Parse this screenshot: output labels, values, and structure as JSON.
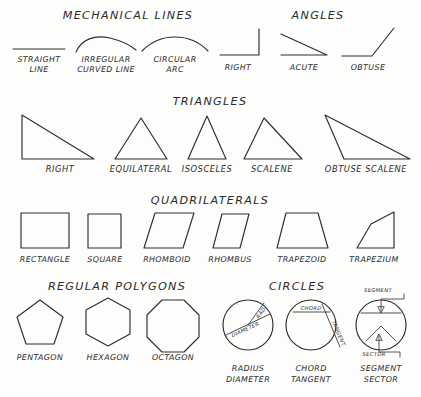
{
  "sheet": {
    "title": "Geometric Shapes and Lines Reference Chart",
    "ink_color": "#2e2e2e",
    "background_color": "#fdfdfb"
  },
  "sections": [
    {
      "id": "mechanical-lines",
      "heading": "MECHANICAL  LINES",
      "figures": [
        {
          "id": "straight-line",
          "caption_line1": "STRAIGHT",
          "caption_line2": "LINE"
        },
        {
          "id": "irregular-curved-line",
          "caption_line1": "IRREGULAR",
          "caption_line2": "CURVED LINE"
        },
        {
          "id": "circular-arc",
          "caption_line1": "CIRCULAR",
          "caption_line2": "ARC"
        }
      ]
    },
    {
      "id": "angles",
      "heading": "ANGLES",
      "figures": [
        {
          "id": "right-angle",
          "caption_line1": "RIGHT"
        },
        {
          "id": "acute-angle",
          "caption_line1": "ACUTE"
        },
        {
          "id": "obtuse-angle",
          "caption_line1": "OBTUSE"
        }
      ]
    },
    {
      "id": "triangles",
      "heading": "TRIANGLES",
      "figures": [
        {
          "id": "right-triangle",
          "caption_line1": "RIGHT"
        },
        {
          "id": "equilateral-triangle",
          "caption_line1": "EQUILATERAL"
        },
        {
          "id": "isosceles-triangle",
          "caption_line1": "ISOSCELES"
        },
        {
          "id": "scalene-triangle",
          "caption_line1": "SCALENE"
        },
        {
          "id": "obtuse-scalene-triangle",
          "caption_line1": "OBTUSE SCALENE"
        }
      ]
    },
    {
      "id": "quadrilaterals",
      "heading": "QUADRILATERALS",
      "figures": [
        {
          "id": "rectangle",
          "caption_line1": "RECTANGLE"
        },
        {
          "id": "square",
          "caption_line1": "SQUARE"
        },
        {
          "id": "rhomboid",
          "caption_line1": "RHOMBOID"
        },
        {
          "id": "rhombus",
          "caption_line1": "RHOMBUS"
        },
        {
          "id": "trapezoid",
          "caption_line1": "TRAPEZOID"
        },
        {
          "id": "trapezium",
          "caption_line1": "TRAPEZIUM"
        }
      ]
    },
    {
      "id": "regular-polygons",
      "heading": "REGULAR POLYGONS",
      "figures": [
        {
          "id": "pentagon",
          "caption_line1": "PENTAGON"
        },
        {
          "id": "hexagon",
          "caption_line1": "HEXAGON"
        },
        {
          "id": "octagon",
          "caption_line1": "OCTAGON"
        }
      ]
    },
    {
      "id": "circles",
      "heading": "CIRCLES",
      "figures": [
        {
          "id": "radius-diameter-circle",
          "caption_line1": "RADIUS",
          "caption_line2": "DIAMETER",
          "annotations": [
            "RAD.",
            "DIAMETER"
          ]
        },
        {
          "id": "chord-tangent-circle",
          "caption_line1": "CHORD",
          "caption_line2": "TANGENT",
          "annotations": [
            "CHORD",
            "TANGENT"
          ]
        },
        {
          "id": "segment-sector-circle",
          "caption_line1": "SEGMENT",
          "caption_line2": "SECTOR",
          "annotations": [
            "SEGMENT",
            "SECTOR"
          ]
        }
      ]
    }
  ]
}
